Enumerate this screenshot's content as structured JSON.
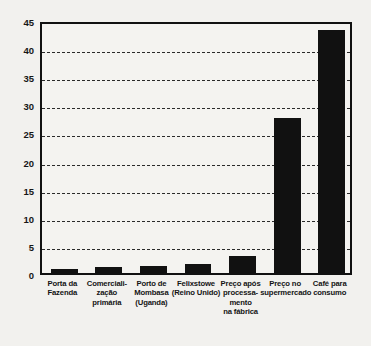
{
  "chart_data": {
    "type": "bar",
    "title": "",
    "subtitle": "",
    "xlabel": "",
    "ylabel": "",
    "categories": [
      "Porta da\nFazenda",
      "Comerciali-\nzação\nprimária",
      "Porto de\nMombasa\n(Uganda)",
      "Felixstowe\n(Reino Unido)",
      "Preço após\nprocessa-\nmento\nna fábrica",
      "Preço no\nsupermercado",
      "Café para\nconsumo"
    ],
    "values": [
      0.7,
      1.0,
      1.3,
      1.6,
      3.0,
      27.5,
      43.2
    ],
    "ylim": [
      0,
      45
    ],
    "ytick_values": [
      0,
      5,
      10,
      15,
      20,
      25,
      30,
      35,
      40,
      45
    ],
    "ytick_labels": [
      "0",
      "5",
      "10",
      "15",
      "20",
      "25",
      "30",
      "35",
      "40",
      "45"
    ],
    "gridline_values": [
      5,
      10,
      15,
      20,
      25,
      30,
      35,
      40
    ],
    "grid": true,
    "grid_style": "dashed",
    "legend": null,
    "legend_position": "none",
    "bar_color": "#111111",
    "background_color": "#f2f1ee",
    "plot_background_color": "#f4f3f0",
    "axis_color": "#111111",
    "grid_color": "#2a2a2a"
  }
}
